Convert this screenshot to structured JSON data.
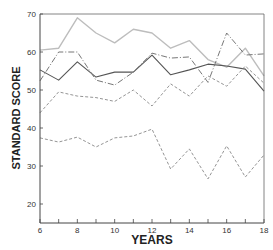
{
  "chart_data": {
    "type": "line",
    "title": "",
    "xlabel": "YEARS",
    "ylabel": "STANDARD SCORE",
    "xlim": [
      6,
      18
    ],
    "ylim": [
      15,
      70
    ],
    "grid": false,
    "legend": "none",
    "x": [
      6,
      7,
      8,
      9,
      10,
      11,
      12,
      13,
      14,
      15,
      16,
      17,
      18
    ],
    "x_ticks": [
      6,
      8,
      10,
      12,
      14,
      16,
      18
    ],
    "y_ticks": [
      20,
      30,
      40,
      50,
      60,
      70
    ],
    "series": [
      {
        "name": "light solid",
        "style": "solid",
        "color": "#bdbdbd",
        "width": 1.4,
        "values": [
          60.5,
          61,
          69,
          65,
          62.4,
          66,
          65,
          61,
          63,
          58,
          56,
          61,
          53.7
        ]
      },
      {
        "name": "dark solid",
        "style": "solid",
        "color": "#555555",
        "width": 1.1,
        "values": [
          55.3,
          52.6,
          57.4,
          53.4,
          54.7,
          54.7,
          59.2,
          54,
          55.3,
          56.8,
          56.3,
          55.5,
          49.7
        ]
      },
      {
        "name": "dash-dot",
        "style": "dashdot",
        "color": "#777777",
        "width": 1.0,
        "values": [
          52.4,
          60,
          60,
          52.6,
          51.3,
          54.7,
          59.7,
          58.4,
          58.7,
          52,
          65,
          59.2,
          59.5
        ]
      },
      {
        "name": "dashed upper",
        "style": "dashed",
        "color": "#888888",
        "width": 0.9,
        "values": [
          44,
          49.5,
          48.4,
          48,
          47,
          50,
          45.8,
          51.6,
          48.4,
          53.7,
          51,
          56.3,
          51.8
        ]
      },
      {
        "name": "dashed lower",
        "style": "dashed",
        "color": "#888888",
        "width": 0.9,
        "values": [
          37.4,
          36.3,
          37.6,
          35,
          37.4,
          37.9,
          39.7,
          29.2,
          34.5,
          26.6,
          35.3,
          27.1,
          32.9
        ]
      }
    ]
  }
}
